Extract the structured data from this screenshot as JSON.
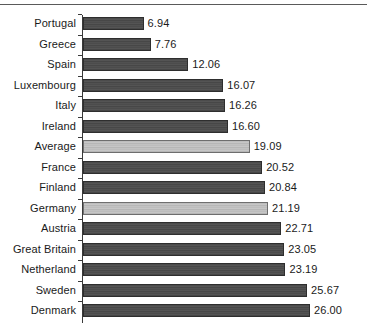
{
  "chart_data": {
    "type": "bar",
    "orientation": "horizontal",
    "title": "",
    "subtitle": "",
    "xlabel": "",
    "ylabel": "",
    "xlim": [
      0,
      26.0
    ],
    "grid": false,
    "legend": null,
    "value_format": "two-decimal",
    "highlight_note": "Average and Germany bars are drawn in light grey; all other bars are dark grey",
    "categories": [
      "Portugal",
      "Greece",
      "Spain",
      "Luxembourg",
      "Italy",
      "Ireland",
      "Average",
      "France",
      "Finland",
      "Germany",
      "Austria",
      "Great Britain",
      "Netherland",
      "Sweden",
      "Denmark"
    ],
    "values": [
      6.94,
      7.76,
      12.06,
      16.07,
      16.26,
      16.6,
      19.09,
      20.52,
      20.84,
      21.19,
      22.71,
      23.05,
      23.19,
      25.67,
      26.0
    ],
    "labels": [
      "6.94",
      "7.76",
      "12.06",
      "16.07",
      "16.26",
      "16.60",
      "19.09",
      "20.52",
      "20.84",
      "21.19",
      "22.71",
      "23.05",
      "23.19",
      "25.67",
      "26.00"
    ],
    "bar_styles": [
      "dark",
      "dark",
      "dark",
      "dark",
      "dark",
      "dark",
      "light",
      "dark",
      "dark",
      "light",
      "dark",
      "dark",
      "dark",
      "dark",
      "dark"
    ],
    "colors": {
      "bar_dark": "#4c4c4c",
      "bar_dark_outline": "#2e2e2e",
      "bar_light": "#bdbdbd",
      "bar_light_outline": "#6e6e6e",
      "axis": "#3a3a3a",
      "text": "#1a1a1a",
      "background": "#ffffff",
      "rule": "#5a5a5a"
    }
  }
}
